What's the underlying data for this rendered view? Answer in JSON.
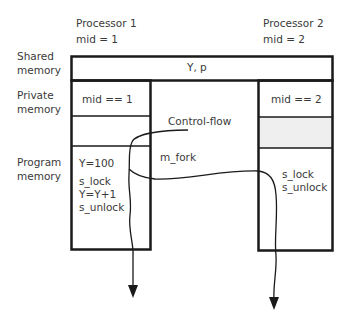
{
  "processors": [
    {
      "name": "Processor 1",
      "mid": "mid = 1"
    },
    {
      "name": "Processor 2",
      "mid": "mid = 2"
    }
  ],
  "row_labels": {
    "shared": [
      "Shared",
      "memory"
    ],
    "private": [
      "Private",
      "memory"
    ],
    "program": [
      "Program",
      "memory"
    ]
  },
  "shared_memory": {
    "content": "Y, p"
  },
  "processor1": {
    "private": "mid == 1",
    "program": [
      "Y=100",
      "s_lock",
      "Y=Y+1",
      "s_unlock"
    ]
  },
  "processor2": {
    "private": "mid == 2",
    "program": [
      "s_lock",
      "s_unlock"
    ]
  },
  "annotations": {
    "control_flow": "Control-flow",
    "fork": "m_fork"
  },
  "colors": {
    "line": "#1a1a1a",
    "shaded": "#efefef"
  }
}
